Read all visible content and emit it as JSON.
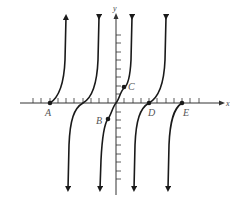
{
  "figure": {
    "axes": {
      "x_label": "x",
      "y_label": "y"
    },
    "points": [
      {
        "label": "A",
        "note": "x-intercept on leftmost branch"
      },
      {
        "label": "B",
        "note": "point below x-axis on central branch"
      },
      {
        "label": "C",
        "note": "point above x-axis on central branch"
      },
      {
        "label": "D",
        "note": "x-intercept on fourth branch"
      },
      {
        "label": "E",
        "note": "x-intercept on rightmost branch"
      }
    ],
    "colors": {
      "curve": "#1a1a1a",
      "axis": "#333333",
      "label": "#555555"
    }
  }
}
